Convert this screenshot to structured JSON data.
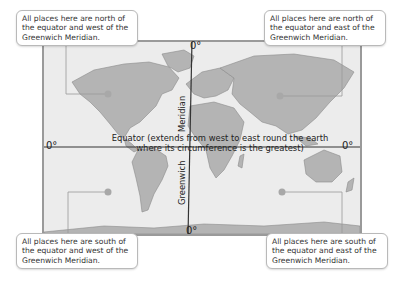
{
  "diagram": {
    "type": "world map with equator and Greenwich meridian",
    "colors": {
      "land": "#b4b4b4",
      "sea": "#ececec",
      "frame": "#9a9a9a",
      "line": "#333333",
      "dot": "#a8a8a8"
    },
    "callouts": {
      "nw": "All places here are north of the equator and west of the Greenwich Meridian.",
      "ne": "All places here are north of the equator and east of the Greenwich Meridian.",
      "sw": "All places here are south of the equator and west of the Greenwich Meridian.",
      "se": "All places here are south of the equator and east of the Greenwich Meridian."
    },
    "equator": {
      "label_line1": "Equator (extends from west to east round the earth",
      "label_line2": "where its circumference is the greatest)",
      "deg_left": "0°",
      "deg_right": "0°"
    },
    "meridian": {
      "label_top": "Meridian",
      "label_bottom": "Greenwich",
      "deg_top": "0°",
      "deg_bottom": "0°"
    }
  }
}
